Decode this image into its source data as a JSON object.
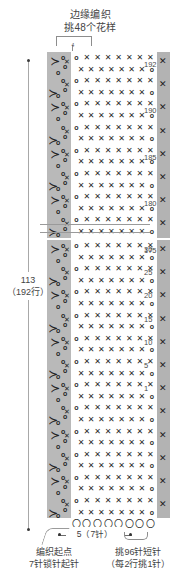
{
  "title": {
    "line1": "边缘编织",
    "line2": "挑48个花样"
  },
  "top_bracket": {
    "count": "4"
  },
  "left_dimension": {
    "measure": "113",
    "rows": "（192行）"
  },
  "bottom": {
    "width_label": "5（7针）",
    "start_note_line1": "编织起点",
    "start_note_line2": "7针锁针起针",
    "pickup_note_line1": "挑96针短针",
    "pickup_note_line2": "（每2行挑1针）"
  },
  "row_numbers_upper": [
    "192",
    "190",
    "185",
    "180",
    "175"
  ],
  "row_numbers_lower": [
    "30",
    "25",
    "20",
    "15",
    "10",
    "5",
    "1"
  ],
  "symbols": {
    "single_crochet": "✕",
    "chain": "o",
    "shell": "⋎",
    "edge_stitch": "✕"
  },
  "colors": {
    "motif_band": "#b9b9b9",
    "edge_band": "#b3b3b3",
    "line": "#8d8d8d",
    "text": "#444444"
  },
  "chart_data": {
    "type": "table",
    "title": "边缘编织 挑48个花样",
    "total_rows": 192,
    "foundation_chain": 7,
    "pattern_repeats": 48,
    "pickup_stitches": 96,
    "sections": [
      {
        "name": "upper",
        "visible_rows": [
          "192",
          "191",
          "190",
          "189",
          "188",
          "187",
          "186",
          "185",
          "184",
          "183",
          "182",
          "181",
          "180",
          "179",
          "178",
          "177",
          "176",
          "175"
        ]
      },
      {
        "name": "lower",
        "visible_rows": [
          "30",
          "29",
          "28",
          "27",
          "26",
          "25",
          "24",
          "23",
          "22",
          "21",
          "20",
          "19",
          "18",
          "17",
          "16",
          "15",
          "14",
          "13",
          "12",
          "11",
          "10",
          "9",
          "8",
          "7",
          "6",
          "5",
          "4",
          "3",
          "2",
          "1"
        ]
      }
    ]
  }
}
